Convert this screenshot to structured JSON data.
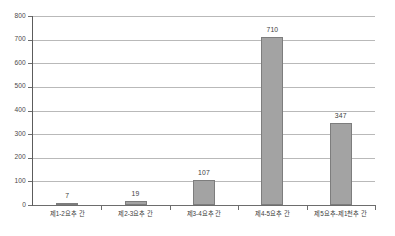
{
  "chart_data": {
    "type": "bar",
    "title": "",
    "subtitle": "",
    "xlabel": "",
    "ylabel": "",
    "categories": [
      "제1-2요추 간",
      "제2-3요추 간",
      "제3-4요추 간",
      "제4-5요추 간",
      "제5요추-제1천추 간"
    ],
    "values": [
      7,
      19,
      107,
      710,
      347
    ],
    "value_labels": [
      "7",
      "19",
      "107",
      "710",
      "347"
    ],
    "ylim": [
      0,
      800
    ],
    "ytick_labels": [
      "800",
      "700",
      "600",
      "500",
      "400",
      "300",
      "200",
      "100",
      "0"
    ],
    "ytick_values": [
      800,
      700,
      600,
      500,
      400,
      300,
      200,
      100,
      0
    ],
    "grid": true,
    "legend": false,
    "legend_position": "none",
    "bar_color": "#a3a3a3",
    "bar_border_color": "#7d7d7d",
    "gridline_color": "#b9b9b9",
    "axis_color": "#5c5c5c",
    "background_color": "#ffffff"
  }
}
